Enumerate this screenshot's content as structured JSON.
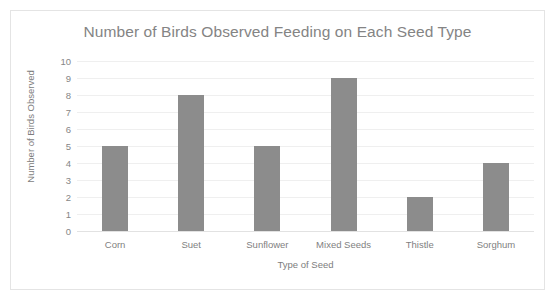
{
  "chart_data": {
    "type": "bar",
    "title": "Number of Birds Observed Feeding on Each Seed Type",
    "xlabel": "Type of Seed",
    "ylabel": "Number of Birds Observed",
    "categories": [
      "Corn",
      "Suet",
      "Sunflower",
      "Mixed Seeds",
      "Thistle",
      "Sorghum"
    ],
    "values": [
      5,
      8,
      5,
      9,
      2,
      4
    ],
    "ylim": [
      0,
      10
    ],
    "ytick_labels": [
      "10",
      "9",
      "8",
      "7",
      "6",
      "5",
      "4",
      "3",
      "2",
      "1",
      "0"
    ],
    "ytick_values": [
      10,
      9,
      8,
      7,
      6,
      5,
      4,
      3,
      2,
      1,
      0
    ],
    "ytick_step": 1,
    "grid": "horizontal",
    "legend": "none",
    "bar_color": "#8c8c8c",
    "gridline_color": "#efefef",
    "axis_line_color": "#e2e2e2",
    "title_color": "#848484",
    "label_color": "#7d7d7d",
    "frame_border_color": "#e4e4e4",
    "background_color": "#ffffff"
  }
}
